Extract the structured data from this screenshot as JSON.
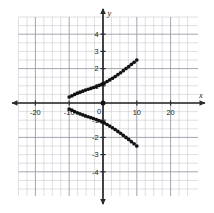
{
  "figure": {
    "title": "",
    "axis_labels": {
      "x": "x",
      "y": "y"
    },
    "origin_label": "0"
  },
  "chart_data": {
    "type": "scatter",
    "title": "",
    "xlabel": "x",
    "ylabel": "y",
    "xlim": [
      -25,
      25
    ],
    "ylim": [
      -5,
      5
    ],
    "xticks": [
      -20,
      -10,
      10,
      20
    ],
    "xtick_labels": [
      "-20",
      "-10",
      "10",
      "20"
    ],
    "yticks": [
      -4,
      -3,
      -2,
      -1,
      1,
      2,
      3,
      4
    ],
    "ytick_labels": [
      "-4",
      "-3",
      "-2",
      "-1",
      "1",
      "2",
      "3",
      "4"
    ],
    "grid": true,
    "grid_minor_step_x": 2.5,
    "grid_minor_step_y": 0.5,
    "grid_major_step_x": 10,
    "grid_major_step_y": 2,
    "legend": "none",
    "marker": "filled-circle",
    "marker_color": "#111111",
    "series": [
      {
        "name": "upper-branch",
        "x": [
          -10.0,
          -9.2,
          -8.4,
          -7.6,
          -6.8,
          -6.0,
          -5.2,
          -4.4,
          -3.6,
          -2.8,
          -2.0,
          -1.2,
          -0.4,
          0.0,
          0.4,
          1.2,
          2.0,
          2.8,
          3.6,
          4.4,
          5.2,
          6.0,
          6.8,
          7.6,
          8.4,
          9.2,
          10.0
        ],
        "y": [
          0.35,
          0.42,
          0.5,
          0.57,
          0.63,
          0.69,
          0.75,
          0.8,
          0.85,
          0.9,
          0.96,
          1.02,
          1.09,
          1.12,
          1.16,
          1.25,
          1.34,
          1.44,
          1.54,
          1.65,
          1.76,
          1.88,
          2.0,
          2.12,
          2.25,
          2.37,
          2.5
        ]
      },
      {
        "name": "lower-branch",
        "x": [
          -10.0,
          -9.2,
          -8.4,
          -7.6,
          -6.8,
          -6.0,
          -5.2,
          -4.4,
          -3.6,
          -2.8,
          -2.0,
          -1.2,
          -0.4,
          0.0,
          0.4,
          1.2,
          2.0,
          2.8,
          3.6,
          4.4,
          5.2,
          6.0,
          6.8,
          7.6,
          8.4,
          9.2,
          10.0
        ],
        "y": [
          -0.35,
          -0.42,
          -0.5,
          -0.57,
          -0.63,
          -0.69,
          -0.75,
          -0.8,
          -0.85,
          -0.9,
          -0.96,
          -1.02,
          -1.09,
          -1.12,
          -1.16,
          -1.25,
          -1.34,
          -1.44,
          -1.54,
          -1.65,
          -1.76,
          -1.88,
          -2.0,
          -2.12,
          -2.25,
          -2.37,
          -2.5
        ]
      },
      {
        "name": "origin-point",
        "x": [
          0.0
        ],
        "y": [
          0.0
        ]
      }
    ]
  }
}
